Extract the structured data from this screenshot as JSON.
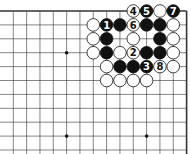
{
  "board": {
    "origin_x": 13.3,
    "origin_y": 11,
    "spacing_x": 13.33,
    "spacing_y": 13.9,
    "cols": 14,
    "rows": 11,
    "top_edge": true,
    "right_edge": true,
    "hoshi": [
      [
        4,
        3
      ],
      [
        10,
        3
      ],
      [
        4,
        9
      ],
      [
        10,
        9
      ]
    ],
    "line_color": "#333333"
  },
  "stones": [
    {
      "c": 9,
      "r": 0,
      "color": "white",
      "label": "4"
    },
    {
      "c": 10,
      "r": 0,
      "color": "black",
      "label": "5"
    },
    {
      "c": 11,
      "r": 0,
      "color": "white",
      "label": ""
    },
    {
      "c": 12,
      "r": 0,
      "color": "black",
      "label": "7"
    },
    {
      "c": 6,
      "r": 1,
      "color": "white",
      "label": ""
    },
    {
      "c": 7,
      "r": 1,
      "color": "black",
      "label": "1"
    },
    {
      "c": 8,
      "r": 1,
      "color": "black",
      "label": ""
    },
    {
      "c": 9,
      "r": 1,
      "color": "white",
      "label": "6"
    },
    {
      "c": 10,
      "r": 1,
      "color": "black",
      "label": ""
    },
    {
      "c": 11,
      "r": 1,
      "color": "black",
      "label": ""
    },
    {
      "c": 12,
      "r": 1,
      "color": "white",
      "label": ""
    },
    {
      "c": 6,
      "r": 2,
      "color": "white",
      "label": ""
    },
    {
      "c": 7,
      "r": 2,
      "color": "black",
      "label": ""
    },
    {
      "c": 9,
      "r": 2,
      "color": "white",
      "label": ""
    },
    {
      "c": 11,
      "r": 2,
      "color": "black",
      "label": ""
    },
    {
      "c": 12,
      "r": 2,
      "color": "white",
      "label": ""
    },
    {
      "c": 6,
      "r": 3,
      "color": "white",
      "label": ""
    },
    {
      "c": 7,
      "r": 3,
      "color": "black",
      "label": ""
    },
    {
      "c": 8,
      "r": 3,
      "color": "white",
      "label": ""
    },
    {
      "c": 9,
      "r": 3,
      "color": "white",
      "label": "2"
    },
    {
      "c": 10,
      "r": 3,
      "color": "black",
      "label": ""
    },
    {
      "c": 11,
      "r": 3,
      "color": "black",
      "label": ""
    },
    {
      "c": 12,
      "r": 3,
      "color": "white",
      "label": ""
    },
    {
      "c": 7,
      "r": 4,
      "color": "white",
      "label": ""
    },
    {
      "c": 8,
      "r": 4,
      "color": "black",
      "label": ""
    },
    {
      "c": 9,
      "r": 4,
      "color": "black",
      "label": ""
    },
    {
      "c": 10,
      "r": 4,
      "color": "black",
      "label": "3"
    },
    {
      "c": 11,
      "r": 4,
      "color": "white",
      "label": "8"
    },
    {
      "c": 12,
      "r": 4,
      "color": "white",
      "label": ""
    },
    {
      "c": 7,
      "r": 5,
      "color": "white",
      "label": ""
    },
    {
      "c": 8,
      "r": 5,
      "color": "white",
      "label": ""
    },
    {
      "c": 9,
      "r": 5,
      "color": "white",
      "label": ""
    },
    {
      "c": 10,
      "r": 5,
      "color": "white",
      "label": ""
    }
  ]
}
